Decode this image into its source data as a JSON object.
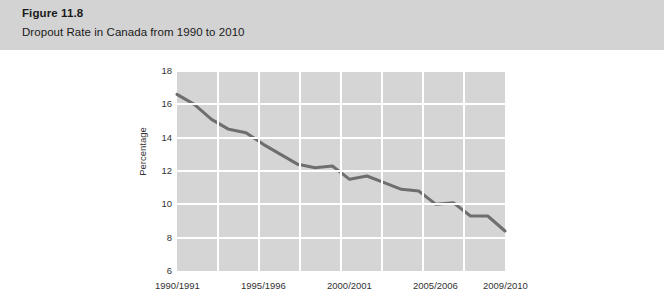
{
  "header": {
    "figure_number": "Figure 11.8",
    "caption": "Dropout Rate in Canada from 1990 to 2010",
    "band_color": "#d3d3d3"
  },
  "chart_data": {
    "type": "line",
    "title": "Dropout Rate in Canada from 1990 to 2010",
    "xlabel": "",
    "ylabel": "Percentage",
    "ylim": [
      6,
      18
    ],
    "ytick_values": [
      6,
      8,
      10,
      12,
      14,
      16,
      18
    ],
    "ytick_labels": [
      "6",
      "8",
      "10",
      "12",
      "14",
      "16",
      "18"
    ],
    "xtick_labels": [
      "1990/1991",
      "1995/1996",
      "2000/2001",
      "2005/2006",
      "2009/2010"
    ],
    "xtick_positions": [
      0,
      5,
      10,
      15,
      19
    ],
    "grid": true,
    "legend": false,
    "plot_background": "#d5d5d5",
    "gridline_color": "#ffffff",
    "line_color": "#6e6e6e",
    "line_width": 3,
    "categories": [
      "1990/1991",
      "1991/1992",
      "1992/1993",
      "1993/1994",
      "1994/1995",
      "1995/1996",
      "1996/1997",
      "1997/1998",
      "1998/1999",
      "1999/2000",
      "2000/2001",
      "2001/2002",
      "2002/2003",
      "2003/2004",
      "2004/2005",
      "2005/2006",
      "2006/2007",
      "2007/2008",
      "2008/2009",
      "2009/2010"
    ],
    "values": [
      16.6,
      16.0,
      15.1,
      14.5,
      14.3,
      13.6,
      13.0,
      12.4,
      12.2,
      12.3,
      11.5,
      11.7,
      11.3,
      10.9,
      10.8,
      10.0,
      10.1,
      9.3,
      9.3,
      8.4
    ]
  }
}
